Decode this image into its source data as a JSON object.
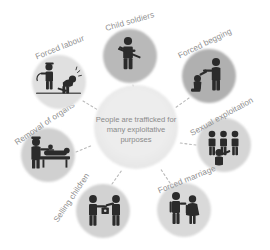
{
  "diagram": {
    "type": "hub-and-spoke",
    "title_center": {
      "lines": [
        "People are trafficked for",
        "many  exploitative",
        "purposes"
      ],
      "line1": "People are trafficked for",
      "line2": "many  exploitative",
      "line3": "purposes"
    },
    "colors": {
      "background": "#ffffff",
      "center_circle": "#ececec",
      "node_light": "#dcdcdc",
      "node_mid": "#c9c9c9",
      "node_dark": "#b4b4b4",
      "label_text": "#8f8f8f",
      "center_text": "#8a8a8a",
      "connector": "#b9b9b9",
      "pictogram_dark": "#2e2e2e",
      "pictogram_light": "#ffffff"
    },
    "nodes": [
      {
        "id": "child-soldiers",
        "label": "Child soldiers",
        "icon": "child-soldier-icon",
        "position": "top",
        "shade": "#b9b9b9",
        "label_rotation": -16,
        "cx": 130,
        "cy": 56,
        "r": 27
      },
      {
        "id": "forced-begging",
        "label": "Forced begging",
        "icon": "begging-icon",
        "position": "top-right",
        "shade": "#b0b0b0",
        "label_rotation": -26,
        "cx": 209,
        "cy": 76,
        "r": 27
      },
      {
        "id": "sexual-exploitation",
        "label": "Sexual exploitation",
        "icon": "sexual-exploitation-icon",
        "position": "right",
        "shade": "#d5d5d5",
        "label_rotation": -28,
        "cx": 224,
        "cy": 145,
        "r": 27
      },
      {
        "id": "forced-marriage",
        "label": "Forced marriage",
        "icon": "forced-marriage-icon",
        "position": "bottom-right",
        "shade": "#d9d9d9",
        "label_rotation": -22,
        "cx": 184,
        "cy": 210,
        "r": 27
      },
      {
        "id": "selling-children",
        "label": "Selling children",
        "icon": "selling-children-icon",
        "position": "bottom-left",
        "shade": "#d2d2d2",
        "label_rotation": -56,
        "cx": 103,
        "cy": 211,
        "r": 27
      },
      {
        "id": "removal-of-organs",
        "label": "Removal of organs",
        "icon": "organ-removal-icon",
        "position": "left",
        "shade": "#d0d0d0",
        "label_rotation": -34,
        "cx": 48,
        "cy": 155,
        "r": 27
      },
      {
        "id": "forced-labour",
        "label": "Forced labour",
        "icon": "forced-labour-icon",
        "position": "top-left",
        "shade": "#e0e0e0",
        "label_rotation": -22,
        "cx": 59,
        "cy": 82,
        "r": 27
      }
    ],
    "center": {
      "cx": 136,
      "cy": 127,
      "r": 42
    }
  }
}
